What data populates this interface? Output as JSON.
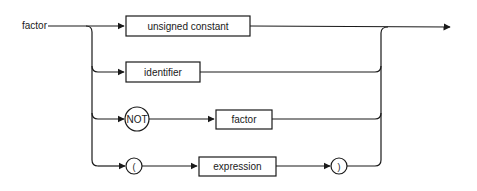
{
  "diagram": {
    "type": "syntax-diagram",
    "rule_name": "factor",
    "alternatives": [
      {
        "elements": [
          {
            "kind": "nonterminal",
            "label": "unsigned constant"
          }
        ]
      },
      {
        "elements": [
          {
            "kind": "nonterminal",
            "label": "identifier"
          }
        ]
      },
      {
        "elements": [
          {
            "kind": "terminal",
            "label": "NOT"
          },
          {
            "kind": "nonterminal",
            "label": "factor"
          }
        ]
      },
      {
        "elements": [
          {
            "kind": "terminal",
            "label": "("
          },
          {
            "kind": "nonterminal",
            "label": "expression"
          },
          {
            "kind": "terminal",
            "label": ")"
          }
        ]
      }
    ]
  },
  "labels": {
    "rule": "factor",
    "unsigned_constant": "unsigned constant",
    "identifier": "identifier",
    "not": "NOT",
    "factor_ref": "factor",
    "lparen": "(",
    "expression": "expression",
    "rparen": ")"
  },
  "colors": {
    "line": "#1a1a1a",
    "background": "#ffffff"
  }
}
